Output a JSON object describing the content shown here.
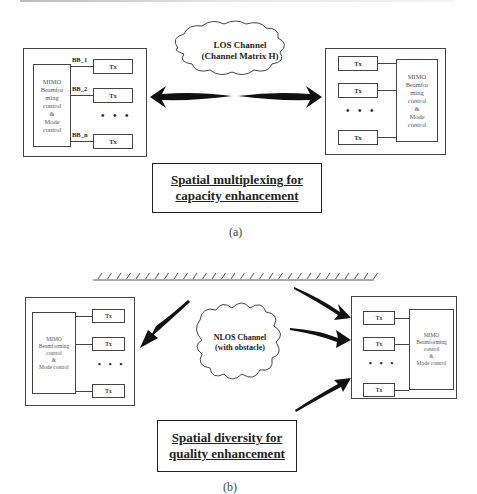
{
  "panel_a": {
    "left_station": {
      "mimo_label": "MIMO\nBeamfor\nming\ncontrol\n&\nMode\ncontrol",
      "bb_labels": [
        "BB_1",
        "BB_2",
        "BB_n"
      ],
      "tx_labels": [
        "Tx",
        "Tx",
        "Tx"
      ],
      "ellipsis": "• • •"
    },
    "channel_label": "LOS Channel\n(Channel Matrix H)",
    "right_station": {
      "mimo_label": "MIMO\nBeamfor\nming\ncontrol\n&\nMode\ncontrol",
      "tx_labels": [
        "Tx",
        "Tx",
        "Tx"
      ],
      "ellipsis": "• • •"
    },
    "caption_line1": "Spatial multiplexing for",
    "caption_line2": "capacity enhancement",
    "sublabel": "(a)"
  },
  "panel_b": {
    "left_station": {
      "mimo_label": "MIMO\nBeamforming\ncontrol\n&\nMode control",
      "tx_labels": [
        "Tx",
        "Tx",
        "Tx"
      ],
      "ellipsis": "• • •"
    },
    "channel_label": "NLOS Channel\n(with obstacle)",
    "right_station": {
      "mimo_label": "MIMO\nBeamforming\ncontrol\n&\nMode control",
      "tx_labels": [
        "Tx",
        "Tx",
        "Tx"
      ],
      "ellipsis": "• • •"
    },
    "caption_line1": "Spatial diversity for",
    "caption_line2": "quality enhancement",
    "sublabel": "(b)"
  },
  "colors": {
    "line": "#444444",
    "arrow": "#111111",
    "text": "#222222"
  }
}
